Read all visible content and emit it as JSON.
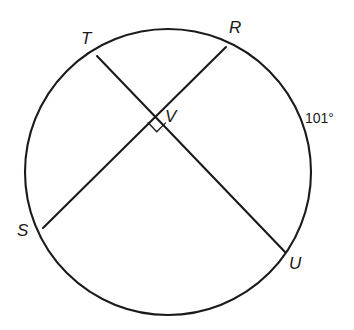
{
  "figure": {
    "type": "circle-with-intersecting-chords",
    "stroke_color": "#1a1a1a",
    "background_color": "#ffffff",
    "circle": {
      "cx": 168,
      "cy": 172,
      "r": 143
    },
    "points": [
      {
        "id": "T",
        "label": "T",
        "x": 97,
        "y": 56,
        "label_x": 81,
        "label_y": 30
      },
      {
        "id": "R",
        "label": "R",
        "x": 226,
        "y": 47,
        "label_x": 229,
        "label_y": 19
      },
      {
        "id": "V",
        "label": "V",
        "x": 157,
        "y": 113,
        "label_x": 165,
        "label_y": 108
      },
      {
        "id": "S",
        "label": "S",
        "x": 43,
        "y": 228,
        "label_x": 17,
        "label_y": 222
      },
      {
        "id": "U",
        "label": "U",
        "x": 285,
        "y": 252,
        "label_x": 289,
        "label_y": 255
      }
    ],
    "chords": [
      {
        "id": "TU",
        "from": "T",
        "to": "U"
      },
      {
        "id": "SR",
        "from": "S",
        "to": "R"
      }
    ],
    "right_angle_marker": {
      "at": "V",
      "size": 13,
      "note": "square marker indicating perpendicular chords"
    },
    "arc_labels": [
      {
        "id": "arc-RU",
        "text": "101°",
        "arc": "RU",
        "label_x": 305,
        "label_y": 111
      }
    ]
  }
}
